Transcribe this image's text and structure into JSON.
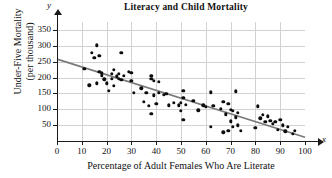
{
  "chart_data": {
    "type": "scatter",
    "title": "Literacy and Child Mortality",
    "xlabel": "Percentage of Adult Females Who Are Literate",
    "ylabel_line1": "Under-Five Mortality",
    "ylabel_line2": "(per thousand)",
    "x_axis_name": "x",
    "y_axis_name": "y",
    "xlim": [
      0,
      100
    ],
    "ylim": [
      0,
      375
    ],
    "xticks": [
      0,
      10,
      20,
      30,
      40,
      50,
      60,
      70,
      80,
      90,
      100
    ],
    "yticks": [
      50,
      100,
      150,
      200,
      250,
      300,
      350
    ],
    "grid": true,
    "grid_color": "#d2d2d2",
    "point_color": "#0d0d0d",
    "trend_color": "#7a7a7a",
    "trendline": {
      "x0": 0,
      "y0": 258,
      "x1": 100,
      "y1": 12
    },
    "points": [
      [
        11,
        228
      ],
      [
        13,
        175
      ],
      [
        14,
        278
      ],
      [
        15,
        263
      ],
      [
        16,
        302
      ],
      [
        16,
        182
      ],
      [
        17,
        268
      ],
      [
        17,
        218
      ],
      [
        18,
        213
      ],
      [
        18,
        206
      ],
      [
        19,
        195
      ],
      [
        20,
        182
      ],
      [
        21,
        159
      ],
      [
        22,
        212
      ],
      [
        22,
        196
      ],
      [
        23,
        225
      ],
      [
        23,
        173
      ],
      [
        24,
        204
      ],
      [
        25,
        212
      ],
      [
        25,
        196
      ],
      [
        26,
        277
      ],
      [
        26,
        192
      ],
      [
        27,
        206
      ],
      [
        29,
        218
      ],
      [
        30,
        215
      ],
      [
        30,
        190
      ],
      [
        31,
        151
      ],
      [
        34,
        166
      ],
      [
        35,
        124
      ],
      [
        36,
        152
      ],
      [
        37,
        110
      ],
      [
        38,
        85
      ],
      [
        38,
        206
      ],
      [
        38,
        196
      ],
      [
        39,
        190
      ],
      [
        39,
        144
      ],
      [
        40,
        117
      ],
      [
        41,
        186
      ],
      [
        41,
        152
      ],
      [
        43,
        145
      ],
      [
        44,
        149
      ],
      [
        45,
        112
      ],
      [
        47,
        120
      ],
      [
        49,
        113
      ],
      [
        50,
        121
      ],
      [
        50,
        96
      ],
      [
        51,
        158
      ],
      [
        51,
        66
      ],
      [
        51,
        136
      ],
      [
        52,
        115
      ],
      [
        55,
        126
      ],
      [
        57,
        97
      ],
      [
        59,
        112
      ],
      [
        60,
        108
      ],
      [
        62,
        153
      ],
      [
        62,
        45
      ],
      [
        63,
        110
      ],
      [
        66,
        101
      ],
      [
        67,
        123
      ],
      [
        67,
        28
      ],
      [
        68,
        84
      ],
      [
        69,
        118
      ],
      [
        69,
        33
      ],
      [
        70,
        99
      ],
      [
        70,
        62
      ],
      [
        71,
        96
      ],
      [
        71,
        45
      ],
      [
        72,
        157
      ],
      [
        72,
        75
      ],
      [
        73,
        50
      ],
      [
        73,
        88
      ],
      [
        74,
        33
      ],
      [
        80,
        41
      ],
      [
        81,
        109
      ],
      [
        82,
        72
      ],
      [
        83,
        82
      ],
      [
        84,
        60
      ],
      [
        85,
        78
      ],
      [
        86,
        64
      ],
      [
        87,
        55
      ],
      [
        88,
        60
      ],
      [
        89,
        36
      ],
      [
        90,
        66
      ],
      [
        91,
        50
      ],
      [
        92,
        30
      ],
      [
        93,
        44
      ],
      [
        95,
        22
      ],
      [
        96,
        33
      ]
    ]
  }
}
